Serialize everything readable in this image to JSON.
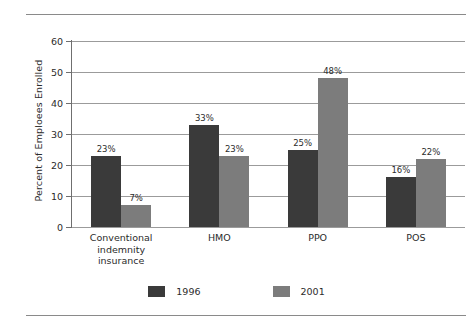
{
  "chart_data": {
    "type": "bar",
    "title": "",
    "subtitle": "",
    "xlabel": "",
    "ylabel": "Percent of Emploees Enrolled",
    "ylim": [
      0,
      60
    ],
    "yticks": [
      0,
      10,
      20,
      30,
      40,
      50,
      60
    ],
    "ytick_labels": [
      "0",
      "10",
      "20",
      "30",
      "40",
      "50",
      "60"
    ],
    "grid": true,
    "legend_position": "bottom-center",
    "categories": [
      "Conventional indemnity insurance",
      "HMO",
      "PPO",
      "POS"
    ],
    "category_lines": [
      [
        "Conventional",
        "indemnity",
        "insurance"
      ],
      [
        "HMO"
      ],
      [
        "PPO"
      ],
      [
        "POS"
      ]
    ],
    "series": [
      {
        "name": "1996",
        "color": "#3a3a3a",
        "values": [
          23,
          33,
          25,
          16
        ],
        "data_labels": [
          "23%",
          "33%",
          "25%",
          "16%"
        ]
      },
      {
        "name": "2001",
        "color": "#7c7c7c",
        "values": [
          7,
          23,
          48,
          22
        ],
        "data_labels": [
          "7%",
          "23%",
          "48%",
          "22%"
        ]
      }
    ]
  },
  "legend": {
    "items": [
      {
        "label": "1996",
        "series": 0
      },
      {
        "label": "2001",
        "series": 1
      }
    ]
  },
  "colors": {
    "series_1996": "#3a3a3a",
    "series_2001": "#7c7c7c",
    "gridline": "#9b9b9b",
    "axis": "#6f6f6f",
    "rule": "#8a8a8a",
    "text": "#2b2b2b",
    "background": "#ffffff"
  }
}
